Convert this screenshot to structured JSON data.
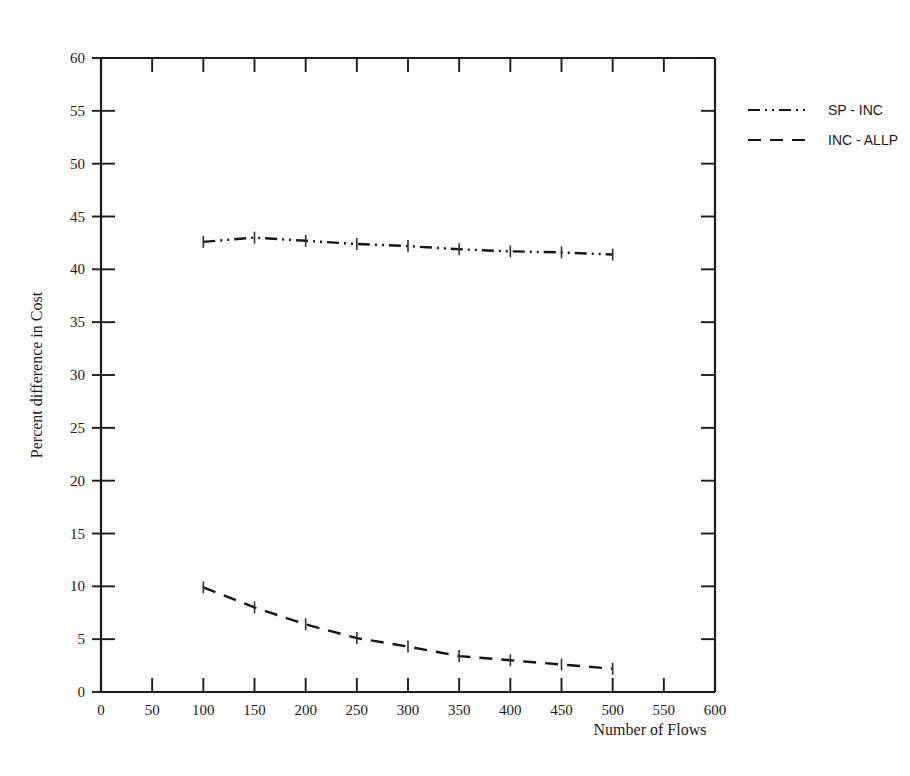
{
  "chart_data": {
    "type": "line",
    "title": "",
    "xlabel": "Number of Flows",
    "ylabel": "Percent difference in Cost",
    "xlim": [
      0,
      600
    ],
    "ylim": [
      0,
      60
    ],
    "xticks": [
      0,
      50,
      100,
      150,
      200,
      250,
      300,
      350,
      400,
      450,
      500,
      550,
      600
    ],
    "yticks": [
      0,
      5,
      10,
      15,
      20,
      25,
      30,
      35,
      40,
      45,
      50,
      55,
      60
    ],
    "xtick_labels": [
      "0",
      "50",
      "100",
      "150",
      "200",
      "250",
      "300",
      "350",
      "400",
      "450",
      "500",
      "550",
      "600"
    ],
    "ytick_labels": [
      "0",
      "5",
      "10",
      "15",
      "20",
      "25",
      "30",
      "35",
      "40",
      "45",
      "50",
      "55",
      "60"
    ],
    "grid": false,
    "legend_position": "right",
    "x": [
      100,
      150,
      200,
      250,
      300,
      350,
      400,
      450,
      500
    ],
    "series": [
      {
        "name": "SP - INC",
        "linestyle": "dashdotdot",
        "color": "#151515",
        "values": [
          42.6,
          43.0,
          42.7,
          42.4,
          42.2,
          41.9,
          41.7,
          41.6,
          41.4
        ]
      },
      {
        "name": "INC - ALLP",
        "linestyle": "dashed",
        "color": "#151515",
        "values": [
          9.9,
          8.0,
          6.4,
          5.1,
          4.3,
          3.4,
          3.0,
          2.6,
          2.2
        ]
      }
    ]
  },
  "legend": {
    "entries": [
      {
        "label": "SP - INC",
        "style": "dashdotdot"
      },
      {
        "label": "INC - ALLP",
        "style": "dashed"
      }
    ]
  },
  "axes": {
    "x_title": "Number of Flows",
    "y_title": "Percent difference in Cost"
  }
}
